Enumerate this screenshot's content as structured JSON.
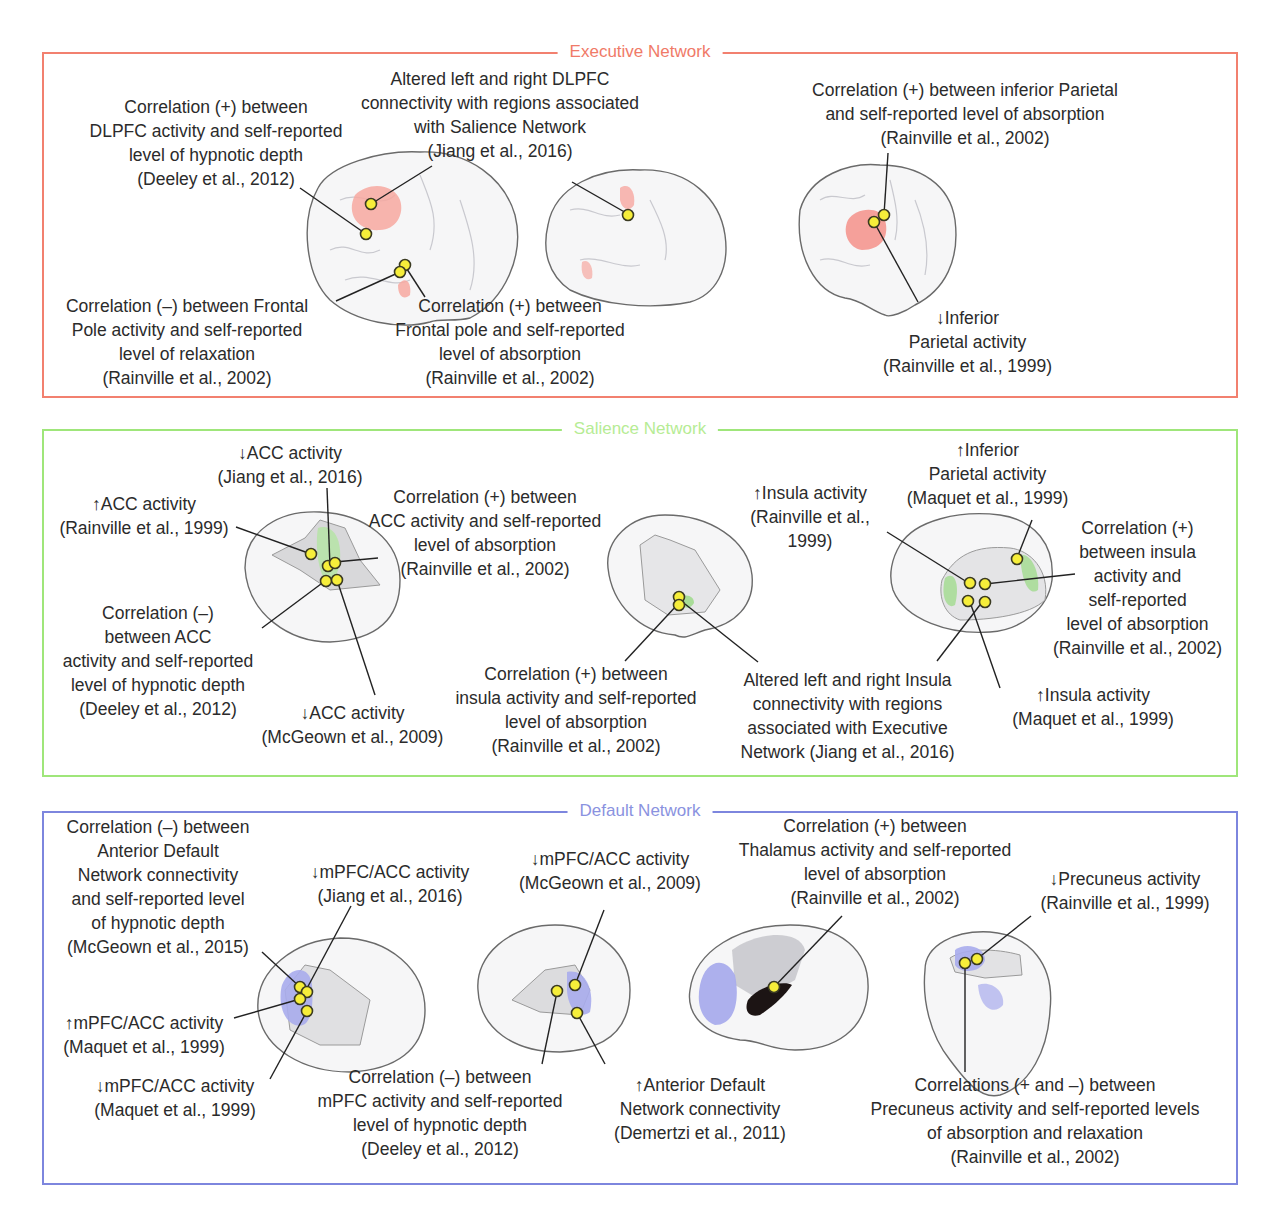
{
  "panels": {
    "executive": {
      "title": "Executive Network",
      "color": "#f07a68",
      "labels": [
        {
          "text": "Correlation (+) between\nDLPFC activity and self-reported\nlevel of hypnotic depth\n(Deeley et al., 2012)"
        },
        {
          "text": "Altered left and right DLPFC\nconnectivity with regions associated\nwith Salience Network\n(Jiang et al., 2016)"
        },
        {
          "text": "Correlation (+) between inferior Parietal\nand self-reported level of absorption\n(Rainville et al., 2002)"
        },
        {
          "text": "Correlation (–) between Frontal\nPole activity and self-reported\nlevel of relaxation\n(Rainville et al., 2002)"
        },
        {
          "text": "Correlation (+) between\nFrontal pole and self-reported\nlevel of absorption\n(Rainville et al., 2002)"
        },
        {
          "text": "↓Inferior\nParietal activity\n(Rainville et al., 1999)"
        }
      ]
    },
    "salience": {
      "title": "Salience Network",
      "color": "#b6ec94",
      "labels": [
        {
          "text": "↓ACC activity\n(Jiang et al., 2016)"
        },
        {
          "text": "↑ACC activity\n(Rainville et al., 1999)"
        },
        {
          "text": "Correlation (+) between\nACC activity and self-reported\nlevel of absorption\n(Rainville et al., 2002)"
        },
        {
          "text": "Correlation (–)\nbetween ACC\nactivity and self-reported\nlevel of hypnotic depth\n(Deeley et al., 2012)"
        },
        {
          "text": "↓ACC activity\n(McGeown et al., 2009)"
        },
        {
          "text": "Correlation (+) between\ninsula activity and self-reported\nlevel of absorption\n(Rainville et al., 2002)"
        },
        {
          "text": "↑Insula activity\n(Rainville et al.,\n1999)"
        },
        {
          "text": "↑Inferior\nParietal activity\n(Maquet et al., 1999)"
        },
        {
          "text": "Correlation (+)\nbetween insula\nactivity and\nself-reported\nlevel of absorption\n(Rainville et al., 2002)"
        },
        {
          "text": "Altered left and right Insula\nconnectivity with regions\nassociated with Executive\nNetwork (Jiang et al., 2016)"
        },
        {
          "text": "↑Insula activity\n(Maquet et al., 1999)"
        }
      ]
    },
    "default": {
      "title": "Default Network",
      "color": "#8a92e0",
      "labels": [
        {
          "text": "Correlation (–) between\nAnterior Default\nNetwork connectivity\nand self-reported level\nof hypnotic depth\n(McGeown et al., 2015)"
        },
        {
          "text": "↓mPFC/ACC activity\n(Jiang et al., 2016)"
        },
        {
          "text": "↓mPFC/ACC activity\n(McGeown et al., 2009)"
        },
        {
          "text": "Correlation (+) between\nThalamus activity and self-reported\nlevel of absorption\n(Rainville et al., 2002)"
        },
        {
          "text": "↓Precuneus activity\n(Rainville et al., 1999)"
        },
        {
          "text": "↑mPFC/ACC activity\n(Maquet et al., 1999)"
        },
        {
          "text": "↓mPFC/ACC activity\n(Maquet et al., 1999)"
        },
        {
          "text": "Correlation (–) between\nmPFC activity and self-reported\nlevel of hypnotic depth\n(Deeley et al., 2012)"
        },
        {
          "text": "↑Anterior Default\nNetwork connectivity\n(Demertzi et al., 2011)"
        },
        {
          "text": "Correlations (+ and –) between\nPrecuneus activity and self-reported levels\nof absorption and relaxation\n(Rainville et al., 2002)"
        }
      ]
    }
  },
  "colors": {
    "marker": "#f6ee3a",
    "executive_region": "#f7a8a0",
    "salience_region": "#a8dc98",
    "default_region": "#a9acec"
  }
}
